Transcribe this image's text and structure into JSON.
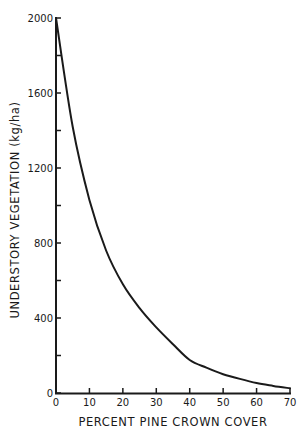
{
  "chart_data": {
    "type": "line",
    "title": "",
    "xlabel": "PERCENT PINE CROWN COVER",
    "ylabel": "UNDERSTORY VEGETATION (kg/ha)",
    "xlim": [
      0,
      70
    ],
    "ylim": [
      0,
      2000
    ],
    "grid": false,
    "legend": null,
    "x_ticks": [
      0,
      10,
      20,
      30,
      40,
      50,
      60,
      70
    ],
    "x_tick_labels": [
      "0",
      "10",
      "20",
      "30",
      "40",
      "50",
      "60",
      "70"
    ],
    "y_ticks_major": [
      0,
      400,
      800,
      1200,
      1600,
      2000
    ],
    "y_tick_labels": [
      "0",
      "400",
      "800",
      "1200",
      "1600",
      "2000"
    ],
    "y_ticks_minor": [
      200,
      600,
      1000,
      1400,
      1800
    ],
    "series": [
      {
        "name": "Understory vegetation",
        "x": [
          0,
          5,
          10,
          15,
          20,
          25,
          30,
          35,
          40,
          45,
          50,
          55,
          60,
          65,
          70
        ],
        "values": [
          2000,
          1420,
          1030,
          760,
          580,
          453,
          350,
          260,
          176,
          135,
          100,
          75,
          53,
          38,
          25
        ]
      }
    ]
  },
  "labels": {
    "xlabel": "PERCENT PINE CROWN COVER",
    "ylabel": "UNDERSTORY VEGETATION (kg/ha)"
  }
}
